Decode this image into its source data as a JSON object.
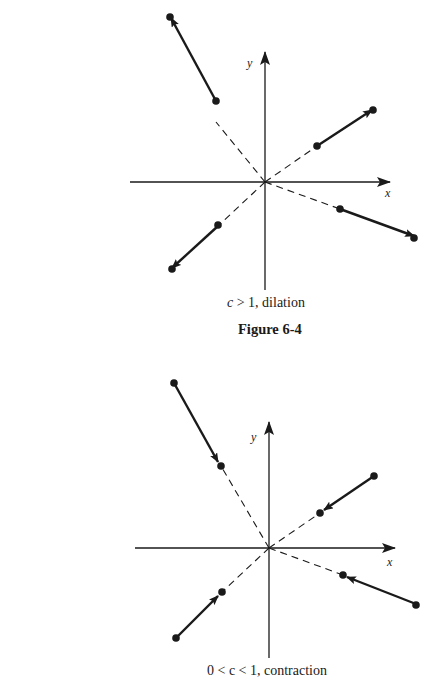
{
  "figures": [
    {
      "id": "dilation",
      "caption_c": "c",
      "caption_rest": " > 1, dilation",
      "title": "Figure 6-4",
      "axis_x_label": "x",
      "axis_y_label": "y",
      "origin": [
        265,
        182
      ],
      "vectors": [
        {
          "from": [
            216,
            72
          ],
          "to": [
            171,
            18
          ]
        },
        {
          "from": [
            317,
            146
          ],
          "to": [
            372,
            110
          ]
        },
        {
          "from": [
            218,
            226
          ],
          "to": [
            172,
            268
          ]
        },
        {
          "from": [
            340,
            209
          ],
          "to": [
            414,
            238
          ]
        }
      ]
    },
    {
      "id": "contraction",
      "caption": "0 < c < 1, contraction",
      "axis_x_label": "x",
      "axis_y_label": "y",
      "origin": [
        269,
        548
      ],
      "vectors": [
        {
          "from": [
            174,
            383
          ],
          "to": [
            221,
            466
          ]
        },
        {
          "from": [
            374,
            476
          ],
          "to": [
            320,
            513
          ]
        },
        {
          "from": [
            176,
            638
          ],
          "to": [
            222,
            592
          ]
        },
        {
          "from": [
            416,
            604
          ],
          "to": [
            343,
            575
          ]
        }
      ]
    }
  ],
  "colors": {
    "ink": "#1a1a1a",
    "background": "#ffffff"
  }
}
